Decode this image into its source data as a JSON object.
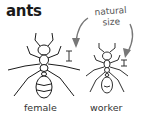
{
  "title": "ants",
  "annotation": {
    "line1": "natural",
    "line2": "size"
  },
  "figures": [
    {
      "label": "female",
      "scale_marker": "natural-size-bar"
    },
    {
      "label": "worker",
      "scale_marker": "natural-size-bar"
    }
  ],
  "colors": {
    "ink": "#1a1a1a",
    "arrow": "#777777",
    "background": "#ffffff"
  }
}
